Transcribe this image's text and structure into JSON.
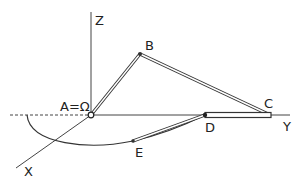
{
  "diagram": {
    "type": "mechanism-linkage",
    "colors": {
      "line": "#333333",
      "link_fill": "#ffffff",
      "background": "#ffffff"
    },
    "axes": {
      "z": {
        "label": "Z"
      },
      "y": {
        "label": "Y"
      },
      "x": {
        "label": "X"
      }
    },
    "points": {
      "origin": {
        "label": "A=Ω"
      },
      "b": {
        "label": "B"
      },
      "c": {
        "label": "C"
      },
      "d": {
        "label": "D"
      },
      "e": {
        "label": "E"
      }
    }
  }
}
